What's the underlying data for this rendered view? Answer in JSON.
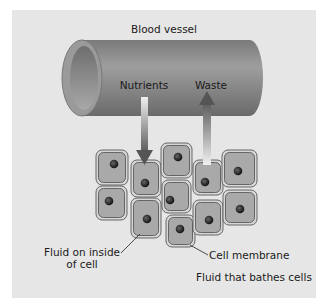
{
  "diagram": {
    "title": "Blood vessel",
    "labels": {
      "nutrients": "Nutrients",
      "waste": "Waste",
      "fluid_inside_line1": "Fluid on inside",
      "fluid_inside_line2": "of cell",
      "cell_membrane": "Cell membrane",
      "fluid_bathes": "Fluid that bathes cells"
    },
    "colors": {
      "panel_background": "#e6e6e6",
      "vessel": "#8a8a8a",
      "cell_fill": "#a9a9a9",
      "cell_membrane": "#5a5a5a",
      "nucleus": "#222222"
    },
    "cell_count": 11
  }
}
